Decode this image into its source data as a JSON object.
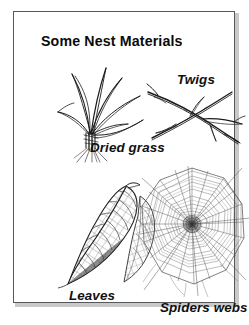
{
  "figure": {
    "title": "Some Nest Materials",
    "background_color": "#ffffff",
    "ink_color": "#111111",
    "frame_color": "#55595c",
    "items": [
      {
        "id": "dried-grass",
        "caption": "Dried grass",
        "icon": "dried-grass-illustration",
        "description": "Bundle of long dried grass blades tied at the base with splayed roots"
      },
      {
        "id": "twigs",
        "caption": "Twigs",
        "icon": "twigs-illustration",
        "description": "Two crossing woody twigs with small side branches"
      },
      {
        "id": "leaves",
        "caption": "Leaves",
        "icon": "leaves-illustration",
        "description": "Skeletonised leaf showing net-like vein structure with a second leaf behind"
      },
      {
        "id": "spiders-webs",
        "caption": "Spiders webs",
        "icon": "spider-web-illustration",
        "description": "Circular orb web with radial spokes and spiral capture threads"
      }
    ]
  }
}
